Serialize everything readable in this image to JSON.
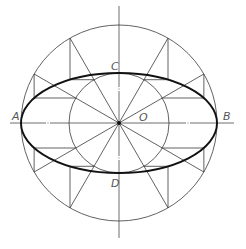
{
  "diagram": {
    "center": {
      "x": 119,
      "y": 123
    },
    "outer_radius": 98,
    "inner_radius": 50,
    "ellipse": {
      "rx": 98,
      "ry": 50
    },
    "radial_angles_deg": [
      0,
      30,
      60,
      90,
      120,
      150,
      180,
      210,
      240,
      270,
      300,
      330
    ],
    "construction_angles_deg": [
      30,
      60,
      120,
      150,
      210,
      240,
      300,
      330
    ],
    "h_axis": {
      "x1": 10,
      "x2": 234,
      "gaps": [
        48,
        188
      ]
    },
    "v_axis": {
      "y1": 6,
      "y2": 238,
      "gaps": [
        89,
        158
      ]
    },
    "colors": {
      "line": "#3a3a3a",
      "ellipse": "#111111",
      "label": "#555555"
    },
    "labels": {
      "A": {
        "text": "A",
        "x": 12,
        "y": 111
      },
      "B": {
        "text": "B",
        "x": 223,
        "y": 111
      },
      "C": {
        "text": "C",
        "x": 111,
        "y": 61
      },
      "D": {
        "text": "D",
        "x": 111,
        "y": 178
      },
      "O": {
        "text": "O",
        "x": 139,
        "y": 112
      }
    }
  }
}
